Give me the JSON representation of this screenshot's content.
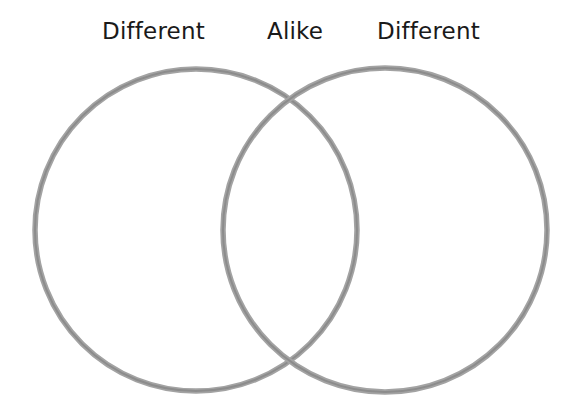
{
  "diagram": {
    "type": "venn",
    "labels": {
      "left": "Different",
      "center": "Alike",
      "right": "Different"
    },
    "circles": [
      {
        "id": "left",
        "cx": 196,
        "cy": 230,
        "r": 161
      },
      {
        "id": "right",
        "cx": 385,
        "cy": 230,
        "r": 162
      }
    ],
    "stroke_color": "#9a9a9a",
    "stroke_core_color": "#8a8a8a",
    "text_color": "#1a1a1a",
    "background": "#ffffff"
  }
}
